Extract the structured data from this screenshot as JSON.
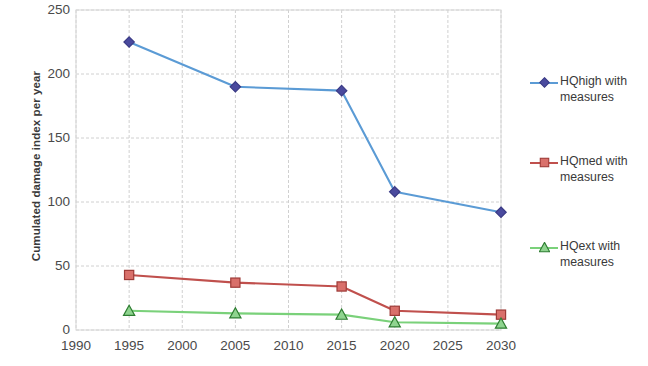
{
  "chart_data": {
    "type": "line",
    "title": "",
    "xlabel": "",
    "ylabel": "Cumulated damage index per year",
    "xlim": [
      1990,
      2030
    ],
    "ylim": [
      0,
      250
    ],
    "x_ticks": [
      1990,
      1995,
      2000,
      2005,
      2010,
      2015,
      2020,
      2025,
      2030
    ],
    "y_ticks": [
      0,
      50,
      100,
      150,
      200,
      250
    ],
    "grid": true,
    "legend_position": "right",
    "x": [
      1995,
      2005,
      2015,
      2020,
      2030
    ],
    "series": [
      {
        "name": "HQhigh with measures",
        "color": "#5b9bd5",
        "marker": "diamond",
        "marker_color": "#4a4a9e",
        "values": [
          225,
          190,
          187,
          108,
          92
        ]
      },
      {
        "name": "HQmed with measures",
        "color": "#c0504d",
        "marker": "square",
        "marker_color": "#d9706b",
        "values": [
          43,
          37,
          34,
          15,
          12
        ]
      },
      {
        "name": "HQext with measures",
        "color": "#7ad17a",
        "marker": "triangle",
        "marker_color": "#8fd48f",
        "values": [
          15,
          13,
          12,
          6,
          5
        ]
      }
    ]
  },
  "legend": {
    "entries": [
      {
        "label": "HQhigh with measures"
      },
      {
        "label": "HQmed with measures"
      },
      {
        "label": "HQext with measures"
      }
    ]
  },
  "axis": {
    "y_title": "Cumulated damage index per year",
    "y_tick_labels": [
      "250",
      "200",
      "150",
      "100",
      "50",
      "0"
    ],
    "x_tick_labels": [
      "1990",
      "1995",
      "2000",
      "2005",
      "2010",
      "2015",
      "2020",
      "2025",
      "2030"
    ]
  }
}
